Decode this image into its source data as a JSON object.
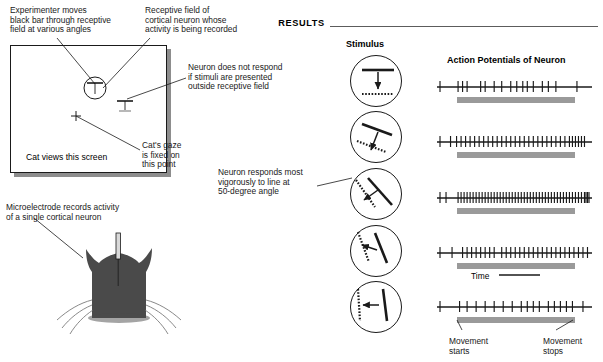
{
  "left_panel": {
    "annotations": {
      "experimenter": "Experimenter moves\nblack bar through receptive\nfield at various angles",
      "receptive_field": "Receptive field of\ncortical neuron whose\nactivity is being recorded",
      "no_response": "Neuron does not respond\nif stimuli are presented\noutside receptive field",
      "gaze": "Cat's gaze\nis fixed on\nthis point",
      "best_angle": "Neuron responds most\nvigorously to line at\n50-degree angle",
      "microelectrode": "Microelectrode records activity\nof a single cortical neuron"
    },
    "screen_caption": "Cat views this screen",
    "fixation_marker": "+"
  },
  "right_panel": {
    "header": "RESULTS",
    "stimulus_column_label": "Stimulus",
    "response_column_label": "Action Potentials of Neuron",
    "time_label": "Time",
    "movement_start_label": "Movement\nstarts",
    "movement_stop_label": "Movement\nstops"
  },
  "colors": {
    "ink": "#1a1a1a",
    "movement_bar": "#9a9a9a",
    "shadow": "#8d8d8d",
    "rule": "#5c5c5c"
  },
  "chart_data": {
    "type": "raster",
    "title": "Action Potentials of Neuron",
    "xlabel": "Time",
    "bar_angles_deg": [
      0,
      20,
      50,
      70,
      85
    ],
    "trials": [
      {
        "index": 1,
        "angle_deg": 0,
        "spike_count": 17,
        "spike_times": [
          2,
          14,
          17,
          20,
          29,
          32,
          38,
          43,
          49,
          53,
          57,
          60,
          64,
          70,
          74,
          79,
          93
        ],
        "movement_window": [
          13,
          80
        ]
      },
      {
        "index": 2,
        "angle_deg": 20,
        "spike_count": 33,
        "spike_times": [
          2,
          9,
          13,
          16,
          19,
          22,
          25,
          28,
          31,
          34,
          37,
          40,
          43,
          46,
          49,
          52,
          55,
          58,
          61,
          64,
          67,
          70,
          73,
          76,
          79,
          82,
          85,
          88,
          90,
          92,
          94,
          96,
          98
        ],
        "movement_window": [
          13,
          80
        ]
      },
      {
        "index": 3,
        "angle_deg": 50,
        "spike_count": 48,
        "spike_times": [
          2,
          6,
          14,
          16,
          18,
          20,
          22,
          24,
          26,
          28,
          30,
          32,
          34,
          36,
          38,
          40,
          42,
          44,
          46,
          48,
          50,
          52,
          54,
          56,
          58,
          60,
          62,
          64,
          66,
          68,
          70,
          72,
          74,
          76,
          78,
          80,
          82,
          84,
          86,
          88,
          90,
          92,
          94,
          96,
          98,
          99,
          100,
          101
        ],
        "movement_window": [
          13,
          80
        ]
      },
      {
        "index": 4,
        "angle_deg": 70,
        "spike_count": 30,
        "spike_times": [
          2,
          10,
          17,
          20,
          23,
          26,
          29,
          32,
          35,
          38,
          43,
          46,
          49,
          52,
          55,
          58,
          61,
          64,
          67,
          70,
          73,
          76,
          79,
          82,
          85,
          88,
          91,
          94,
          97,
          100
        ],
        "movement_window": [
          13,
          80
        ]
      },
      {
        "index": 5,
        "angle_deg": 85,
        "spike_count": 18,
        "spike_times": [
          2,
          15,
          20,
          26,
          32,
          38,
          44,
          50,
          56,
          60,
          64,
          68,
          74,
          78,
          82,
          86,
          90,
          97
        ],
        "movement_window": [
          13,
          80
        ]
      }
    ]
  }
}
